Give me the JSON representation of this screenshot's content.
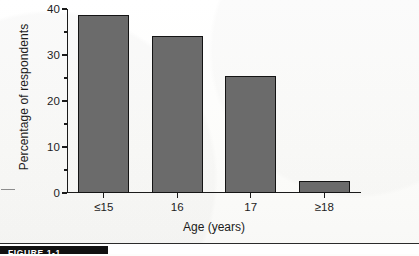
{
  "chart_data": {
    "type": "bar",
    "title": "",
    "xlabel": "Age (years)",
    "ylabel": "Percentage of respondents",
    "categories": [
      "≤15",
      "16",
      "17",
      "≥18"
    ],
    "values": [
      38.7,
      34.2,
      25.5,
      2.7
    ],
    "ylim": [
      0,
      40
    ],
    "yticks_major": [
      0,
      10,
      20,
      30,
      40
    ],
    "yticks_minor": [
      5,
      15,
      25,
      35
    ],
    "ytick_labels": [
      "0",
      "10",
      "20",
      "30",
      "40"
    ],
    "grid": false,
    "legend": null,
    "bar_color": "#6b6b6b",
    "bar_edge_color": "#141414",
    "axis_color": "#1b1b1b"
  },
  "caption": {
    "figure_tag": "FIGURE 1-1"
  }
}
